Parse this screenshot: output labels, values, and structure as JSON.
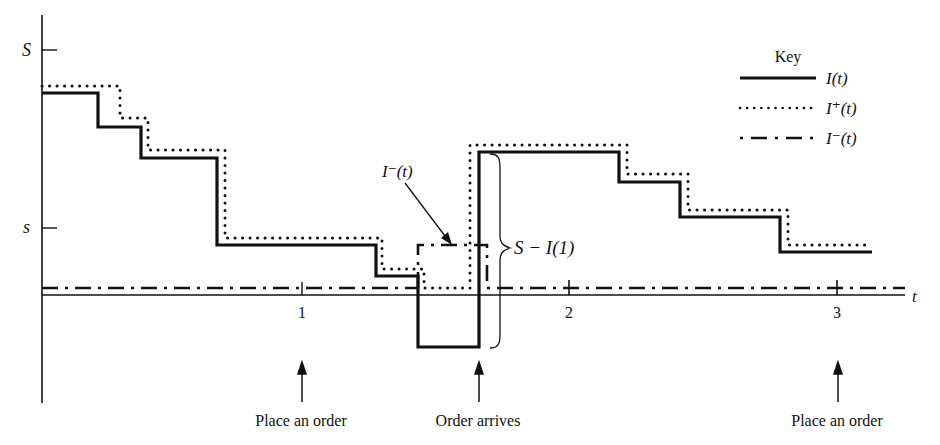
{
  "diagram": {
    "type": "inventory-level-step-diagram",
    "y_axis": {
      "ticks": [
        {
          "label": "S",
          "meaning": "max inventory level"
        },
        {
          "label": "s",
          "meaning": "reorder point"
        }
      ]
    },
    "x_axis": {
      "label": "t",
      "ticks": [
        "1",
        "2",
        "3"
      ]
    },
    "legend": {
      "title": "Key",
      "items": [
        {
          "label": "I(t)",
          "style": "solid"
        },
        {
          "label": "I⁺(t)",
          "style": "dotted"
        },
        {
          "label": "I⁻(t)",
          "style": "dash-dot"
        }
      ]
    },
    "annotations": {
      "i_minus_callout": "I⁻(t)",
      "brace_label": "S − I(1)"
    },
    "events": [
      {
        "label": "Place an order",
        "t": 1
      },
      {
        "label": "Order arrives",
        "t": 1.7
      },
      {
        "label": "Place an order",
        "t": 3
      }
    ],
    "colors": {
      "ink": "#111111",
      "background": "#ffffff"
    }
  }
}
